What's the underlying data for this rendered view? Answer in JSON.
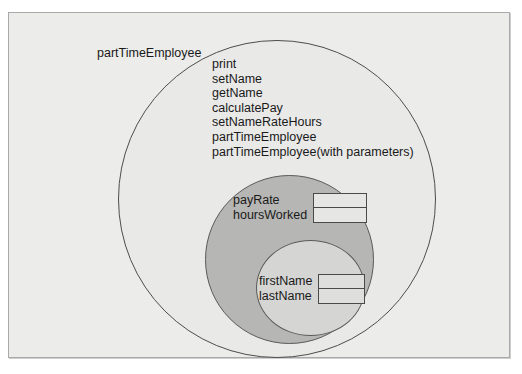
{
  "diagram": {
    "title": "partTimeEmployee",
    "type": "nested-circles-class-diagram",
    "colors": {
      "page_background": "#ececeb",
      "outer_circle_fill": "#e9e9e8",
      "middle_circle_fill": "#b6b6b4",
      "inner_circle_fill": "#d5d5d3",
      "outline": "#4d4d4d",
      "text": "#1a1a1a"
    }
  },
  "outer": {
    "label": "partTimeEmployee",
    "methods": [
      "print",
      "setName",
      "getName",
      "calculatePay",
      "setNameRateHours",
      "partTimeEmployee",
      "partTimeEmployee(with parameters)"
    ]
  },
  "middle": {
    "attributes": [
      "payRate",
      "hoursWorked"
    ]
  },
  "inner": {
    "attributes": [
      "firstName",
      "lastName"
    ]
  }
}
